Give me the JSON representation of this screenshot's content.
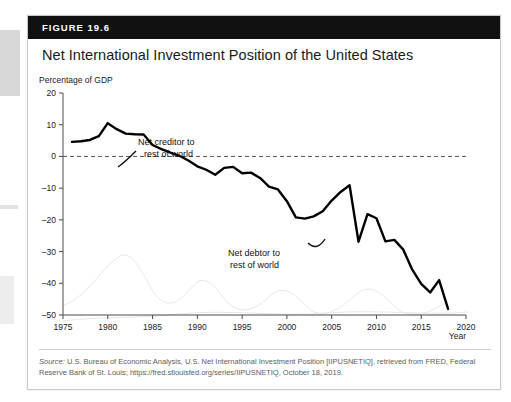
{
  "figure": {
    "number_label": "FIGURE 19.6",
    "title": "Net International Investment Position of the United States"
  },
  "source": {
    "label": "Source:",
    "text": " U.S. Bureau of Economic Analysis, U.S. Net International Investment Position [IIPUSNETIQ], retrieved from FRED, Federal Reserve Bank of St. Louis; https://fred.stlouisfed.org/series/IIPUSNETIQ, October 18, 2019."
  },
  "annotations": {
    "creditor_line1": "Net creditor to",
    "creditor_line2": "rest of world",
    "debtor_line1": "Net debtor to",
    "debtor_line2": "rest of world"
  },
  "chart_data": {
    "type": "line",
    "title": "Net International Investment Position of the United States",
    "xlabel": "Year",
    "ylabel": "Percentage of GDP",
    "xlim": [
      1975,
      2020
    ],
    "ylim": [
      -50,
      20
    ],
    "xticks": [
      1975,
      1980,
      1985,
      1990,
      1995,
      2000,
      2005,
      2010,
      2015,
      2020
    ],
    "yticks": [
      20,
      10,
      0,
      -10,
      -20,
      -30,
      -40,
      -50
    ],
    "grid": false,
    "legend": null,
    "zero_reference_line": 0,
    "series": [
      {
        "name": "Net International Investment Position (% of GDP)",
        "x": [
          1976,
          1977,
          1978,
          1979,
          1980,
          1981,
          1982,
          1983,
          1984,
          1985,
          1986,
          1987,
          1988,
          1989,
          1990,
          1991,
          1992,
          1993,
          1994,
          1995,
          1996,
          1997,
          1998,
          1999,
          2000,
          2001,
          2002,
          2003,
          2004,
          2005,
          2006,
          2007,
          2008,
          2009,
          2010,
          2011,
          2012,
          2013,
          2014,
          2015,
          2016,
          2017,
          2018
        ],
        "values": [
          4.6,
          4.8,
          5.2,
          6.4,
          10.5,
          8.6,
          7.2,
          7.0,
          6.9,
          3.6,
          2.3,
          1.2,
          0.2,
          -1.3,
          -3.1,
          -4.2,
          -5.8,
          -3.6,
          -3.3,
          -5.3,
          -5.1,
          -6.8,
          -9.5,
          -10.4,
          -14.1,
          -19.2,
          -19.6,
          -18.9,
          -17.3,
          -13.9,
          -11.2,
          -9.1,
          -26.9,
          -18.2,
          -19.5,
          -26.8,
          -26.3,
          -29.4,
          -35.7,
          -40.2,
          -42.9,
          -39.0,
          -48.1
        ]
      }
    ],
    "annotations": [
      {
        "text": "Net creditor to rest of world",
        "x": 1988,
        "y": 7
      },
      {
        "text": "Net debtor to rest of world",
        "x": 2000,
        "y": -26
      }
    ]
  }
}
